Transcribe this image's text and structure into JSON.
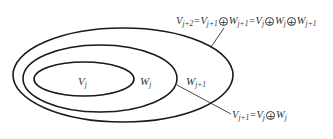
{
  "diagram": {
    "regions": {
      "inner": {
        "symbol": "V",
        "sub": "j"
      },
      "middle": {
        "symbol": "W",
        "sub": "j"
      },
      "outer": {
        "symbol": "W",
        "sub": "j+1"
      }
    },
    "equations": {
      "top": {
        "parts": [
          "V",
          "j+2",
          "=V",
          "j+1",
          "W",
          "j+1",
          "=V",
          "j",
          "W",
          "j",
          "W",
          "j+1"
        ],
        "text": "Vj+2=Vj+1⊕Wj+1=Vj⊕Wj⊕Wj+1"
      },
      "bottom": {
        "parts": [
          "V",
          "j+1",
          "=V",
          "j",
          "W",
          "j"
        ],
        "text": "Vj+1=Vj⊕Wj"
      }
    },
    "operator_symbol": "+",
    "colors": {
      "stroke": "#1a1a1a",
      "text": "#333333",
      "background": "#ffffff"
    }
  }
}
